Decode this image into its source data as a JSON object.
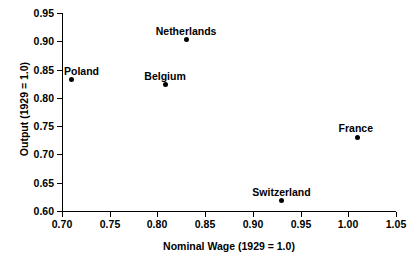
{
  "chart_data": {
    "type": "scatter",
    "title": "",
    "xlabel": "Nominal Wage (1929 = 1.0)",
    "ylabel": "Output (1929 = 1.0)",
    "xlim": [
      0.7,
      1.05
    ],
    "ylim": [
      0.6,
      0.95
    ],
    "xticks": [
      "0.70",
      "0.75",
      "0.80",
      "0.85",
      "0.90",
      "0.95",
      "1.00",
      "1.05"
    ],
    "yticks": [
      "0.60",
      "0.65",
      "0.70",
      "0.75",
      "0.80",
      "0.85",
      "0.90",
      "0.95"
    ],
    "xtick_values": [
      0.7,
      0.75,
      0.8,
      0.85,
      0.9,
      0.95,
      1.0,
      1.05
    ],
    "ytick_values": [
      0.6,
      0.65,
      0.7,
      0.75,
      0.8,
      0.85,
      0.9,
      0.95
    ],
    "grid": false,
    "legend": "none",
    "marker": "filled-circle",
    "marker_color": "#000000",
    "points": [
      {
        "label": "Poland",
        "x": 0.71,
        "y": 0.833,
        "label_dx": 10,
        "label_dy": -13
      },
      {
        "label": "Belgium",
        "x": 0.808,
        "y": 0.823,
        "label_dx": 0,
        "label_dy": -14
      },
      {
        "label": "Netherlands",
        "x": 0.83,
        "y": 0.903,
        "label_dx": 0,
        "label_dy": -14
      },
      {
        "label": "Switzerland",
        "x": 0.93,
        "y": 0.618,
        "label_dx": 0,
        "label_dy": -14
      },
      {
        "label": "France",
        "x": 1.01,
        "y": 0.73,
        "label_dx": -2,
        "label_dy": -14
      }
    ]
  },
  "artifact": {
    "top_strip": ""
  }
}
